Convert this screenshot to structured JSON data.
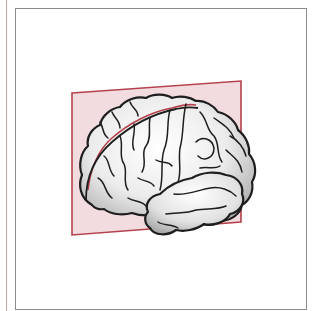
{
  "figure": {
    "plane": "sagittal-plane",
    "colors": {
      "plane_fill": "#f3dcdf",
      "plane_stroke": "#b4414b",
      "brain_fill": "#ececec",
      "brain_shade": "#b8b8b8",
      "outline": "#1e1e1e",
      "frame_border": "#8c8c8c",
      "margin_rule": "#c9a3a6"
    }
  }
}
